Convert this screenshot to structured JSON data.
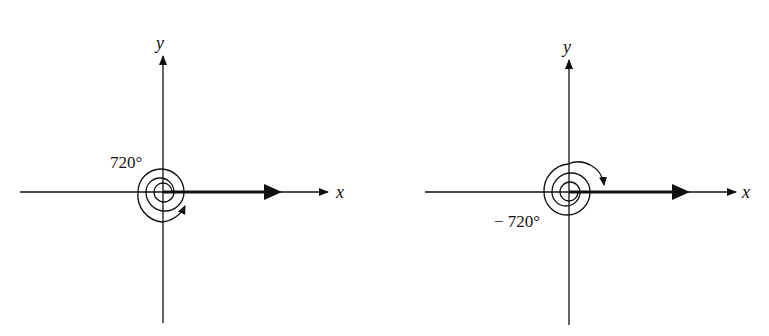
{
  "figures": [
    {
      "id": "left",
      "x_label": "x",
      "y_label": "y",
      "angle_label": "720°",
      "direction": "counterclockwise",
      "rotations": 2
    },
    {
      "id": "right",
      "x_label": "x",
      "y_label": "y",
      "angle_label": "− 720°",
      "direction": "clockwise",
      "rotations": 2
    }
  ],
  "colors": {
    "ink": "#111111",
    "background": "#ffffff"
  }
}
